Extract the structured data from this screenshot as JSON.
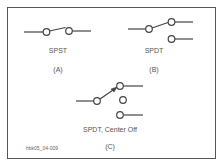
{
  "diagram": {
    "panels": [
      {
        "id": "A",
        "name": "SPST",
        "caption": "(A)"
      },
      {
        "id": "B",
        "name": "SPDT",
        "caption": "(B)"
      },
      {
        "id": "C",
        "name": "SPDT, Center Off",
        "caption": "(C)"
      }
    ],
    "figure_id": "hbk05_04-009",
    "colors": {
      "stroke": "#444444",
      "border": "#555555",
      "text": "#555555"
    }
  }
}
